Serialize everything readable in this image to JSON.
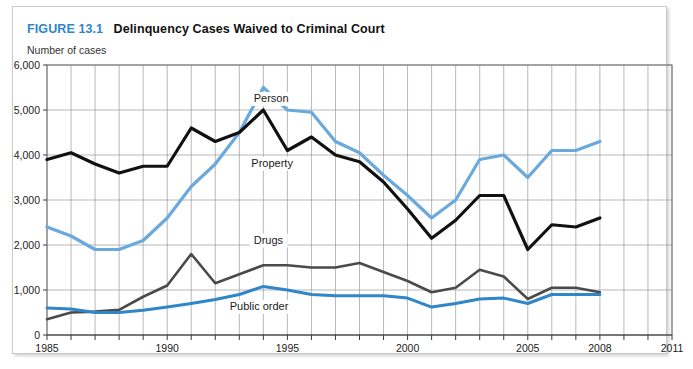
{
  "figure": {
    "number": "FIGURE 13.1",
    "title": "Delinquency Cases Waived to Criminal Court",
    "unit_label": "Number of cases",
    "accent_color": "#2f86c8"
  },
  "chart_data": {
    "type": "line",
    "title": "Delinquency Cases Waived to Criminal Court",
    "xlabel": "",
    "ylabel": "Number of cases",
    "xlim": [
      1985,
      2011
    ],
    "ylim": [
      0,
      6000
    ],
    "ytick_labels": [
      "0",
      "1,000",
      "2,000",
      "3,000",
      "4,000",
      "5,000",
      "6,000"
    ],
    "ytick_values": [
      0,
      1000,
      2000,
      3000,
      4000,
      5000,
      6000
    ],
    "xtick_labels": [
      "1985",
      "1990",
      "1995",
      "2000",
      "2005",
      "2008",
      "2011"
    ],
    "xtick_values": [
      1985,
      1990,
      1995,
      2000,
      2005,
      2008,
      2011
    ],
    "grid": true,
    "grid_x_every": 1,
    "legend": "inline-labels",
    "x": [
      1985,
      1986,
      1987,
      1988,
      1989,
      1990,
      1991,
      1992,
      1993,
      1994,
      1995,
      1996,
      1997,
      1998,
      1999,
      2000,
      2001,
      2002,
      2003,
      2004,
      2005,
      2006,
      2007,
      2008
    ],
    "series": [
      {
        "name": "Person",
        "color": "#6aa9de",
        "values": [
          2400,
          2200,
          1900,
          1900,
          2100,
          2600,
          3300,
          3800,
          4500,
          5500,
          5000,
          4950,
          4300,
          4050,
          3550,
          3100,
          2600,
          3000,
          3900,
          4000,
          3500,
          4100,
          4100,
          4300
        ]
      },
      {
        "name": "Property",
        "color": "#111111",
        "values": [
          3900,
          4050,
          3800,
          3600,
          3750,
          3750,
          4600,
          4300,
          4500,
          5000,
          4100,
          4400,
          4000,
          3850,
          3400,
          2800,
          2150,
          2550,
          3100,
          3100,
          1900,
          2450,
          2400,
          2600
        ]
      },
      {
        "name": "Drugs",
        "color": "#4a4a4a",
        "values": [
          350,
          500,
          520,
          560,
          850,
          1100,
          1800,
          1150,
          1350,
          1550,
          1550,
          1500,
          1500,
          1600,
          1400,
          1200,
          950,
          1050,
          1450,
          1300,
          800,
          1050,
          1050,
          950
        ]
      },
      {
        "name": "Public order",
        "color": "#2f86c8",
        "values": [
          600,
          580,
          500,
          500,
          550,
          620,
          700,
          790,
          900,
          1080,
          1000,
          900,
          870,
          870,
          870,
          820,
          620,
          700,
          800,
          820,
          700,
          900,
          900,
          900
        ]
      }
    ],
    "series_labels": [
      {
        "text": "Person",
        "x": 1993.6,
        "y": 5180
      },
      {
        "text": "Property",
        "x": 1993.5,
        "y": 3740
      },
      {
        "text": "Drugs",
        "x": 1993.6,
        "y": 2030
      },
      {
        "text": "Public order",
        "x": 1992.6,
        "y": 560
      }
    ]
  }
}
